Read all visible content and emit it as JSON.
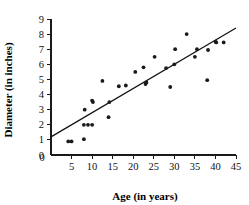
{
  "chart_data": {
    "type": "scatter",
    "title": "",
    "xlabel": "Age (in years)",
    "ylabel": "Diameter (in inches)",
    "xlim": [
      0,
      45
    ],
    "ylim": [
      0,
      9
    ],
    "grid": false,
    "legend": "none",
    "x_ticks": [
      0,
      5,
      10,
      15,
      20,
      25,
      30,
      35,
      40,
      45
    ],
    "x_tick_labels": [
      "0",
      "5",
      "10",
      "15",
      "20",
      "25",
      "30",
      "35",
      "40",
      "45"
    ],
    "y_ticks": [
      0,
      1,
      2,
      3,
      4,
      5,
      6,
      7,
      8,
      9
    ],
    "y_tick_labels": [
      "0",
      "1",
      "2",
      "3",
      "4",
      "5",
      "6",
      "7",
      "8",
      "9"
    ],
    "series": [
      {
        "name": "tree measurements",
        "marker": "filled-circle",
        "color": "#1a1a1a",
        "points": [
          [
            4.2,
            0.9
          ],
          [
            5.0,
            0.9
          ],
          [
            8.0,
            1.05
          ],
          [
            8.0,
            2.0
          ],
          [
            8.2,
            3.0
          ],
          [
            9.0,
            2.0
          ],
          [
            10.0,
            2.0
          ],
          [
            10.2,
            3.5
          ],
          [
            10.0,
            3.6
          ],
          [
            12.5,
            4.9
          ],
          [
            14.0,
            2.5
          ],
          [
            14.2,
            3.5
          ],
          [
            16.5,
            4.55
          ],
          [
            18.2,
            4.6
          ],
          [
            20.5,
            5.5
          ],
          [
            22.5,
            5.8
          ],
          [
            23.0,
            4.7
          ],
          [
            23.2,
            4.8
          ],
          [
            25.2,
            6.5
          ],
          [
            28.0,
            5.75
          ],
          [
            29.0,
            4.5
          ],
          [
            30.0,
            6.0
          ],
          [
            30.2,
            7.0
          ],
          [
            33.0,
            8.0
          ],
          [
            35.0,
            6.5
          ],
          [
            35.5,
            7.0
          ],
          [
            38.0,
            4.95
          ],
          [
            38.2,
            6.95
          ],
          [
            40.0,
            7.5
          ],
          [
            40.2,
            7.45
          ],
          [
            42.0,
            7.45
          ]
        ]
      }
    ],
    "fit_line": {
      "name": "line of best fit",
      "color": "#111111",
      "x_start": 0,
      "y_start": 1.2,
      "x_end": 45,
      "y_end": 8.4
    }
  }
}
